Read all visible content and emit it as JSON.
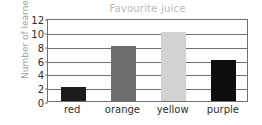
{
  "chart_data": {
    "type": "bar",
    "title": "Favourite juice",
    "xlabel": "",
    "ylabel": "Number of learners",
    "categories": [
      "red",
      "orange",
      "yellow",
      "purple"
    ],
    "values": [
      2,
      8,
      10,
      6
    ],
    "bar_colors": [
      "#1c1c1c",
      "#6e6e6e",
      "#d2d2d2",
      "#0d0d0d"
    ],
    "ylim": [
      0,
      12
    ],
    "y_ticks": [
      0,
      2,
      4,
      6,
      8,
      10,
      12
    ],
    "y_tick_labels": [
      "0",
      "2",
      "4",
      "6",
      "8",
      "10",
      "12"
    ],
    "grid": true,
    "legend": false,
    "title_color": "#b9b9b9",
    "ylabel_color": "#9e9e9e",
    "axis_color": "#6f6f6f",
    "tick_label_color": "#2b2b2b",
    "background_color": "#ffffff"
  }
}
